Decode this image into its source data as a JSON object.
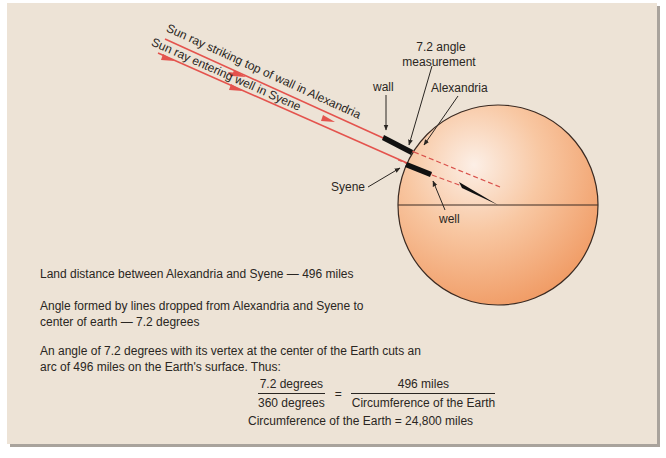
{
  "diagram": {
    "ray_labels": {
      "upper": "Sun ray striking top of wall in Alexandria",
      "lower": "Sun ray entering well in Syene"
    },
    "callouts": {
      "angle_line1": "7.2 angle",
      "angle_line2": "measurement",
      "wall": "wall",
      "alexandria": "Alexandria",
      "syene": "Syene",
      "well": "well"
    },
    "colors": {
      "panel": "#ede3d6",
      "ray": "#e4534d",
      "earth_light": "#fbe9df",
      "earth_dark": "#f2a36f",
      "outline": "#3a2a22"
    }
  },
  "explanation": {
    "land_distance": "Land distance between Alexandria and Syene — 496 miles",
    "angle_line1": "Angle formed by lines dropped from Alexandria and Syene to",
    "angle_line2": "center of earth — 7.2 degrees",
    "arc_line1": "An angle of 7.2 degrees with its vertex at the center of the Earth cuts an",
    "arc_line2": "arc of 496 miles on the Earth's surface. Thus:"
  },
  "equation": {
    "left_numerator": "7.2 degrees",
    "left_denominator": "360 degrees",
    "equals": "=",
    "right_numerator": "496 miles",
    "right_denominator": "Circumference of the Earth",
    "result": "Circumference of the Earth = 24,800 miles"
  }
}
